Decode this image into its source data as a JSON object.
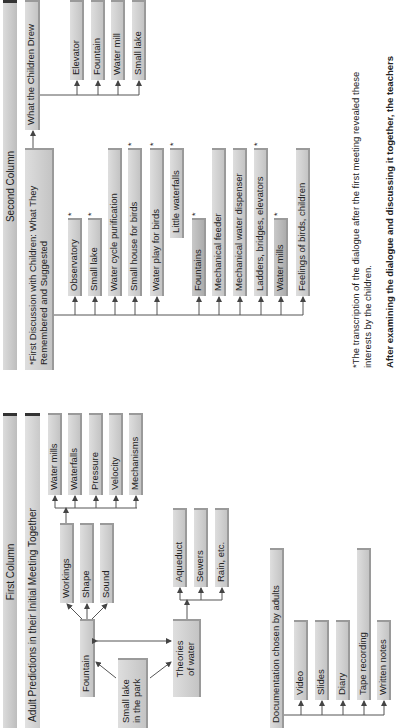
{
  "first_column": {
    "header": "First Column",
    "subheader": "Adult Predictions in their Initial Meeting Together",
    "root": "Small lake\nin the park",
    "fountain": "Fountain",
    "theories": "Theories\nof water",
    "fountain_children": [
      "Workings",
      "Shape",
      "Sound"
    ],
    "workings_children": [
      "Water mills",
      "Waterfalls",
      "Pressure",
      "Velocity",
      "Mechanisms"
    ],
    "theories_children": [
      "Aqueduct",
      "Sewers",
      "Rain, etc."
    ],
    "documentation": {
      "title": "Documentation chosen by adults",
      "items": [
        "Video",
        "Slides",
        "Diary",
        "Tape recording",
        "Written notes"
      ]
    }
  },
  "second_column": {
    "header": "Second Column",
    "discussion_title": "*First Discussion with Children: What They\nRemembered and Suggested",
    "discussion_items": [
      {
        "label": "Observatory",
        "star": "*"
      },
      {
        "label": "Small lake",
        "star": "*"
      },
      {
        "label": "Water cycle purification",
        "star": ""
      },
      {
        "label": "Small house for birds",
        "star": "*"
      },
      {
        "label": "Water play for birds",
        "star": "*"
      },
      {
        "label": "Little waterfalls",
        "star": "*"
      },
      {
        "label": "Fountains",
        "star": "*"
      },
      {
        "label": "Mechanical feeder",
        "star": ""
      },
      {
        "label": "Mechanical water dispenser",
        "star": ""
      },
      {
        "label": "Ladders, bridges, elevators",
        "star": "*"
      },
      {
        "label": "Water mills",
        "star": "*"
      },
      {
        "label": "Feelings of birds, children",
        "star": ""
      }
    ],
    "drew_title": "What the Children Drew",
    "drew_items": [
      "Elevator",
      "Fountain",
      "Water mill",
      "Small lake"
    ]
  },
  "footnote": {
    "line1": "*The transcription of the dialogue after the first meeting revealed these",
    "line2": "interests by the children.",
    "bold": "After examining the dialogue and discussing it together, the teachers"
  }
}
